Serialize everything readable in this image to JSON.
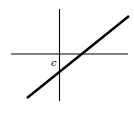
{
  "diagram": {
    "type": "linear function graph",
    "axes": {
      "horizontal": {
        "x1": 11,
        "y1": 54,
        "x2": 128,
        "y2": 54
      },
      "vertical": {
        "x1": 59.5,
        "y1": 9,
        "x2": 59.5,
        "y2": 101
      }
    },
    "line": {
      "x1": 27,
      "y1": 98,
      "x2": 129,
      "y2": 16,
      "color": "#000000"
    },
    "intercept_label": {
      "text": "c",
      "x": 51,
      "y": 66
    }
  }
}
